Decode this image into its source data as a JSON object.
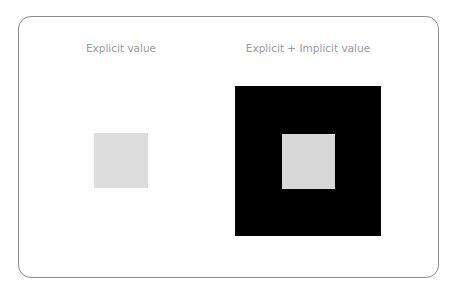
{
  "panels": [
    {
      "label": "Explicit value"
    },
    {
      "label": "Explicit + Implicit value"
    }
  ],
  "colors": {
    "frame_border": "#8a8a8a",
    "label_text": "#9a9a9a",
    "explicit_square": "#dcdcdc",
    "implicit_background": "#000000"
  }
}
